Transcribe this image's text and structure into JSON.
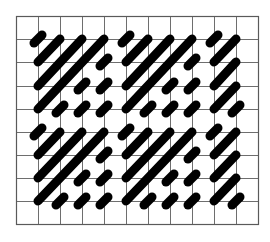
{
  "diagram": {
    "type": "stitch-pattern-grid",
    "grid": {
      "columns": 11,
      "rows": 9,
      "x_lines": [
        16,
        38,
        60,
        82,
        104,
        126,
        148,
        170,
        192,
        214,
        236,
        258
      ],
      "y_lines": [
        16,
        39,
        62,
        86,
        109,
        132,
        155,
        178,
        201,
        224
      ],
      "line_color": "#6e6e6e",
      "background": "#ffffff"
    },
    "stroke_style": {
      "color": "#000000",
      "width": 9,
      "dot_half_length": 4
    },
    "strokes": [
      {
        "from": [
          1,
          1
        ],
        "to": [
          1,
          1
        ]
      },
      {
        "from": [
          1,
          2
        ],
        "to": [
          2,
          1
        ]
      },
      {
        "from": [
          1,
          3
        ],
        "to": [
          3,
          1
        ]
      },
      {
        "from": [
          1,
          4
        ],
        "to": [
          4,
          1
        ]
      },
      {
        "from": [
          4,
          2
        ],
        "to": [
          4,
          2
        ]
      },
      {
        "from": [
          3,
          3
        ],
        "to": [
          3,
          3
        ]
      },
      {
        "from": [
          4,
          3
        ],
        "to": [
          4,
          3
        ]
      },
      {
        "from": [
          2,
          4
        ],
        "to": [
          2,
          4
        ]
      },
      {
        "from": [
          3,
          4
        ],
        "to": [
          3,
          4
        ]
      },
      {
        "from": [
          4,
          4
        ],
        "to": [
          4,
          4
        ]
      },
      {
        "from": [
          1,
          5
        ],
        "to": [
          1,
          5
        ]
      },
      {
        "from": [
          1,
          6
        ],
        "to": [
          2,
          5
        ]
      },
      {
        "from": [
          1,
          7
        ],
        "to": [
          3,
          5
        ]
      },
      {
        "from": [
          1,
          8
        ],
        "to": [
          4,
          5
        ]
      },
      {
        "from": [
          4,
          6
        ],
        "to": [
          4,
          6
        ]
      },
      {
        "from": [
          3,
          7
        ],
        "to": [
          3,
          7
        ]
      },
      {
        "from": [
          4,
          7
        ],
        "to": [
          4,
          7
        ]
      },
      {
        "from": [
          2,
          8
        ],
        "to": [
          2,
          8
        ]
      },
      {
        "from": [
          3,
          8
        ],
        "to": [
          3,
          8
        ]
      },
      {
        "from": [
          4,
          8
        ],
        "to": [
          4,
          8
        ]
      },
      {
        "from": [
          5,
          1
        ],
        "to": [
          5,
          1
        ]
      },
      {
        "from": [
          5,
          2
        ],
        "to": [
          6,
          1
        ]
      },
      {
        "from": [
          5,
          3
        ],
        "to": [
          7,
          1
        ]
      },
      {
        "from": [
          5,
          4
        ],
        "to": [
          8,
          1
        ]
      },
      {
        "from": [
          8,
          2
        ],
        "to": [
          8,
          2
        ]
      },
      {
        "from": [
          7,
          3
        ],
        "to": [
          7,
          3
        ]
      },
      {
        "from": [
          8,
          3
        ],
        "to": [
          8,
          3
        ]
      },
      {
        "from": [
          6,
          4
        ],
        "to": [
          6,
          4
        ]
      },
      {
        "from": [
          7,
          4
        ],
        "to": [
          7,
          4
        ]
      },
      {
        "from": [
          8,
          4
        ],
        "to": [
          8,
          4
        ]
      },
      {
        "from": [
          5,
          5
        ],
        "to": [
          5,
          5
        ]
      },
      {
        "from": [
          5,
          6
        ],
        "to": [
          6,
          5
        ]
      },
      {
        "from": [
          5,
          7
        ],
        "to": [
          7,
          5
        ]
      },
      {
        "from": [
          5,
          8
        ],
        "to": [
          8,
          5
        ]
      },
      {
        "from": [
          8,
          6
        ],
        "to": [
          8,
          6
        ]
      },
      {
        "from": [
          7,
          7
        ],
        "to": [
          7,
          7
        ]
      },
      {
        "from": [
          8,
          7
        ],
        "to": [
          8,
          7
        ]
      },
      {
        "from": [
          6,
          8
        ],
        "to": [
          6,
          8
        ]
      },
      {
        "from": [
          7,
          8
        ],
        "to": [
          7,
          8
        ]
      },
      {
        "from": [
          8,
          8
        ],
        "to": [
          8,
          8
        ]
      },
      {
        "from": [
          9,
          1
        ],
        "to": [
          9,
          1
        ]
      },
      {
        "from": [
          9,
          2
        ],
        "to": [
          10,
          1
        ]
      },
      {
        "from": [
          9,
          3
        ],
        "to": [
          10,
          2
        ]
      },
      {
        "from": [
          9,
          4
        ],
        "to": [
          10,
          3
        ]
      },
      {
        "from": [
          10,
          4
        ],
        "to": [
          10,
          4
        ]
      },
      {
        "from": [
          9,
          5
        ],
        "to": [
          9,
          5
        ]
      },
      {
        "from": [
          9,
          6
        ],
        "to": [
          10,
          5
        ]
      },
      {
        "from": [
          9,
          7
        ],
        "to": [
          10,
          6
        ]
      },
      {
        "from": [
          9,
          8
        ],
        "to": [
          10,
          7
        ]
      },
      {
        "from": [
          10,
          8
        ],
        "to": [
          10,
          8
        ]
      }
    ]
  }
}
